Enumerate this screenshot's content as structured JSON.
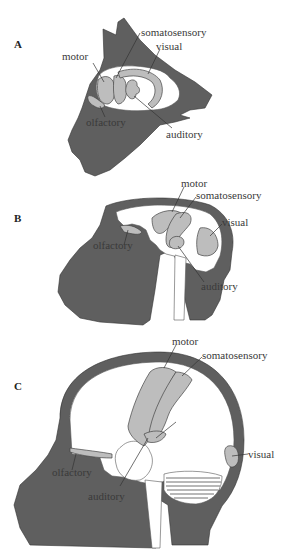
{
  "figure": {
    "panels": [
      {
        "id": "A",
        "subject": "cat",
        "label": "A",
        "regions": {
          "motor": "motor",
          "somatosensory": "somatosensory",
          "visual": "visual",
          "olfactory": "olfactory",
          "auditory": "auditory"
        }
      },
      {
        "id": "B",
        "subject": "monkey",
        "label": "B",
        "regions": {
          "motor": "motor",
          "somatosensory": "somatosensory",
          "visual": "visual",
          "olfactory": "olfactory",
          "auditory": "auditory"
        }
      },
      {
        "id": "C",
        "subject": "human",
        "label": "C",
        "regions": {
          "motor": "motor",
          "somatosensory": "somatosensory",
          "visual": "visual",
          "olfactory": "olfactory",
          "auditory": "auditory"
        }
      }
    ],
    "colors": {
      "head": "#5f5f5f",
      "cortical_area": "#bdbdbd",
      "brain": "#ffffff"
    }
  }
}
